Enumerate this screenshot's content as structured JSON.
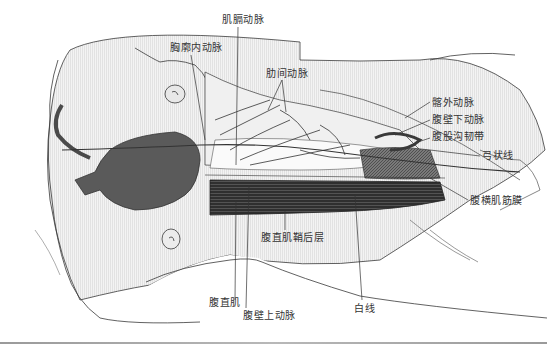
{
  "figure": {
    "labels": [
      {
        "id": "musculophrenic",
        "text": "肌膈动脉",
        "x": 222,
        "y": 14
      },
      {
        "id": "internal-thoracic",
        "text": "胸廓内动脉",
        "x": 170,
        "y": 42
      },
      {
        "id": "intercostal",
        "text": "肋间动脉",
        "x": 266,
        "y": 68
      },
      {
        "id": "external-iliac",
        "text": "髂外动脉",
        "x": 432,
        "y": 97
      },
      {
        "id": "inferior-epigastric",
        "text": "腹壁下动脉",
        "x": 432,
        "y": 116
      },
      {
        "id": "inguinal-ligament",
        "text": "腹股沟韧带",
        "x": 432,
        "y": 133
      },
      {
        "id": "arcuate-line",
        "text": "弓状线",
        "x": 482,
        "y": 151
      },
      {
        "id": "transversalis-fascia",
        "text": "腹横肌筋膜",
        "x": 470,
        "y": 195
      },
      {
        "id": "posterior-rectus-sheath",
        "text": "腹直肌鞘后层",
        "x": 261,
        "y": 233
      },
      {
        "id": "rectus-abdominis",
        "text": "腹直肌",
        "x": 209,
        "y": 297
      },
      {
        "id": "superior-epigastric",
        "text": "腹壁上动脉",
        "x": 243,
        "y": 310
      },
      {
        "id": "linea-alba",
        "text": "白线",
        "x": 354,
        "y": 303
      }
    ]
  },
  "colors": {
    "outline": "#3a3a3a",
    "dark_organ": "#5a5a5a",
    "muscle": "#2e2e2e",
    "shade": "#e6e6e6",
    "label": "#333333",
    "rule": "#a8a8a8"
  }
}
